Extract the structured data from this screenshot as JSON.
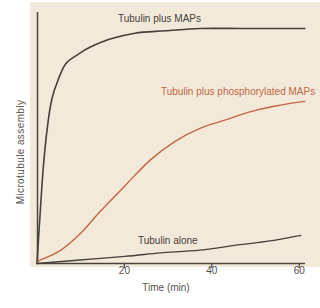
{
  "figure": {
    "background_color": "#ffffff",
    "panel_color": "#f3e9db",
    "dark_text_color": "#45403a",
    "muted_text_color": "#57524c"
  },
  "chart_data": {
    "type": "line",
    "title": "",
    "xlabel": "Time (min)",
    "ylabel": "Microtubule assembly",
    "x_ticks": [
      20,
      40,
      60
    ],
    "xlim": [
      0,
      62
    ],
    "ylim": [
      0,
      1.05
    ],
    "grid": false,
    "legend": "inline-labels-on-plot",
    "axis_color": "#4a443e",
    "tick_text_color": "#55504a",
    "series": [
      {
        "name": "Tubulin plus MAPs",
        "color": "#45403a",
        "stroke_width": 1.6,
        "x": [
          0,
          0.7,
          1.4,
          2.3,
          3.4,
          4.8,
          6.6,
          9.4,
          12.1,
          16.7,
          22.4,
          29.3,
          37.3,
          46.5,
          53.3,
          61.3
        ],
        "y": [
          0,
          0.21,
          0.4,
          0.57,
          0.7,
          0.78,
          0.85,
          0.89,
          0.92,
          0.955,
          0.98,
          0.99,
          1.0,
          1.0,
          1.0,
          1.0
        ]
      },
      {
        "name": "Tubulin plus phosphorylated MAPs",
        "color": "#c06840",
        "stroke_width": 1.4,
        "x": [
          0.2,
          5.3,
          9.8,
          14.4,
          20.1,
          25.9,
          31.6,
          37.3,
          43.0,
          48.7,
          54.5,
          61.3
        ],
        "y": [
          0.01,
          0.055,
          0.125,
          0.22,
          0.33,
          0.44,
          0.52,
          0.575,
          0.61,
          0.645,
          0.67,
          0.69
        ]
      },
      {
        "name": "Tubulin alone",
        "color": "#45403a",
        "stroke_width": 1.3,
        "x": [
          0,
          9.8,
          20.1,
          28.2,
          37.3,
          46.5,
          53.3,
          60.4
        ],
        "y": [
          0,
          0.015,
          0.03,
          0.045,
          0.057,
          0.08,
          0.096,
          0.12
        ]
      }
    ],
    "layout": {
      "x0px": 37,
      "y0px": 263.5,
      "px_per_unit_x": 4.37,
      "px_per_unit_y": 235,
      "y_axis_top_px": 12,
      "x_axis_right_px": 305,
      "tick_length_px": 4.5
    }
  }
}
